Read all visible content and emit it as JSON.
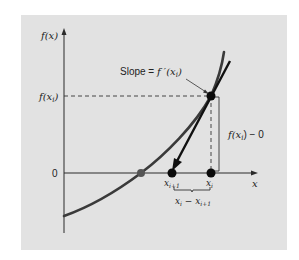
{
  "figure": {
    "type": "newton-raphson-illustration",
    "panel_color": "#e2e2e2",
    "curve_color": "#3a3a3a",
    "axis_color": "#2a2a2a",
    "tangent_color": "#111111"
  },
  "labels": {
    "y_axis": "f(x)",
    "x_axis": "x",
    "f_xi": "f(x",
    "f_xi_sub": "i",
    "f_xi_close": ")",
    "zero": "0",
    "slope_prefix": "Slope = ",
    "slope_expr": "f ′(x",
    "slope_sub": "i",
    "slope_close": ")",
    "vertical_diff": "f(x",
    "vertical_diff_sub": "i",
    "vertical_diff_suffix": ") − 0",
    "x_i_plus_1": "x",
    "x_i_plus_1_sub": "i+1",
    "x_i": "x",
    "x_i_sub": "i",
    "horizontal_diff_a": "x",
    "horizontal_diff_a_sub": "i",
    "horizontal_diff_mid": " − x",
    "horizontal_diff_b_sub": "i+1"
  }
}
